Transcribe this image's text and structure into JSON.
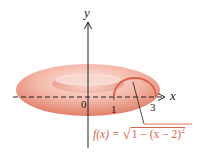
{
  "figure": {
    "type": "torus-of-revolution",
    "axes": {
      "x_label": "x",
      "y_label": "y",
      "origin_label": "0",
      "ticks": [
        "1",
        "3"
      ]
    },
    "curve": {
      "function_prefix": "f(x) = ",
      "sqrt_symbol": "√",
      "radicand": "1 − (x − 2)",
      "exponent": "2",
      "domain": [
        1,
        3
      ],
      "center": [
        2,
        0
      ],
      "radius": 1
    },
    "colors": {
      "torus_fill": "#f3b5a6",
      "torus_shadow": "#e58a76",
      "curve": "#d9634a",
      "axes": "#222222"
    }
  }
}
